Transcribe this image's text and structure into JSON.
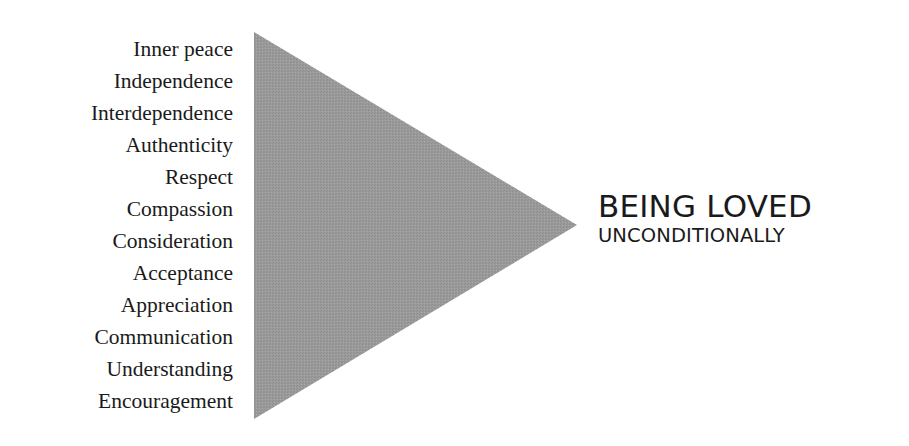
{
  "diagram": {
    "type": "triangle-arrow",
    "inputs": [
      "Inner peace",
      "Independence",
      "Interdependence",
      "Authenticity",
      "Respect",
      "Compassion",
      "Consideration",
      "Acceptance",
      "Appreciation",
      "Communication",
      "Understanding",
      "Encouragement"
    ],
    "outcome": {
      "title": "BEING LOVED",
      "subtitle": "UNCONDITIONALLY"
    },
    "colors": {
      "triangle_fill": "#9a9a9a",
      "text": "#1a1a1a",
      "background": "#ffffff"
    }
  }
}
